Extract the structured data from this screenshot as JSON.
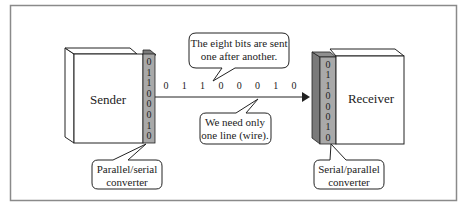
{
  "diagram": {
    "type": "serial-transmission",
    "sender": {
      "label": "Sender"
    },
    "receiver": {
      "label": "Receiver"
    },
    "sender_converter": {
      "bits": [
        "0",
        "1",
        "1",
        "0",
        "0",
        "0",
        "1",
        "0"
      ],
      "callout": [
        "Parallel/serial",
        "converter"
      ]
    },
    "receiver_converter": {
      "bits": [
        "0",
        "1",
        "1",
        "0",
        "0",
        "0",
        "1",
        "0"
      ],
      "callout": [
        "Serial/parallel",
        "converter"
      ]
    },
    "line_bits": [
      "0",
      "1",
      "1",
      "0",
      "0",
      "0",
      "1",
      "0"
    ],
    "callouts": {
      "top": [
        "The eight bits are sent",
        "one after another."
      ],
      "bottom": [
        "We need only",
        "one line (wire)."
      ]
    },
    "colors": {
      "frame": "#8a8a8a",
      "converter_fill": "#a9a9a9",
      "converter_dark": "#7a7a7a",
      "stroke": "#222222",
      "background": "#ffffff"
    }
  }
}
